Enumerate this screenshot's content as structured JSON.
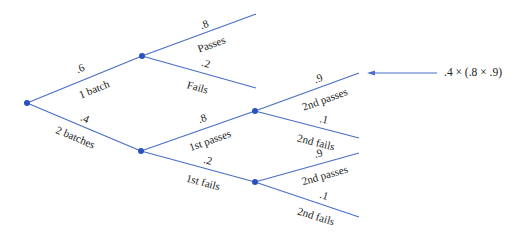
{
  "diagram": {
    "type": "probability-tree",
    "line_color": "#4a6fc7",
    "node_color": "#2a52be",
    "branches": {
      "root_top": {
        "prob": ".6",
        "label": "1 batch"
      },
      "root_bottom": {
        "prob": ".4",
        "label": "2 batches"
      },
      "a_top": {
        "prob": ".8",
        "label": "Passes"
      },
      "a_bottom": {
        "prob": ".2",
        "label": "Fails"
      },
      "b_top": {
        "prob": ".8",
        "label": "1st passes"
      },
      "b_bottom": {
        "prob": ".2",
        "label": "1st fails"
      },
      "c_top": {
        "prob": ".9",
        "label": "2nd passes"
      },
      "c_bottom": {
        "prob": ".1",
        "label": "2nd fails"
      },
      "d_top": {
        "prob": ".9",
        "label": "2nd passes"
      },
      "d_bottom": {
        "prob": ".1",
        "label": "2nd fails"
      }
    },
    "annotation": ".4 × (.8 × .9)"
  }
}
